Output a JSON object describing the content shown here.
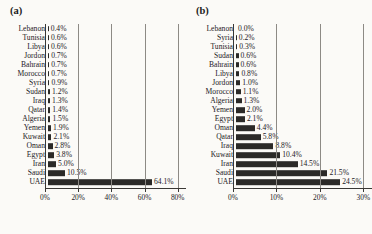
{
  "figure": {
    "background_color": "#fbfaf7",
    "bar_color": "#2b2a28",
    "grid_color": "#8d8a85",
    "axis_color": "#3a3835"
  },
  "panels": [
    {
      "label": "(a)",
      "name": "panel-a"
    },
    {
      "label": "(b)",
      "name": "panel-b"
    }
  ],
  "chart_data": [
    {
      "type": "bar",
      "orientation": "horizontal",
      "title": "(a)",
      "xlabel": "",
      "ylabel": "",
      "xlim": [
        0,
        85
      ],
      "grid": true,
      "legend": "none",
      "xticks": [
        0,
        20,
        40,
        60,
        80
      ],
      "xticklabels": [
        "0%",
        "20%",
        "40%",
        "60%",
        "80%"
      ],
      "categories": [
        "Lebanon",
        "Tunisia",
        "Libya",
        "Jordon",
        "Bahrain",
        "Morocco",
        "Syria",
        "Sudan",
        "Iraq",
        "Qatar",
        "Algeria",
        "Yemen",
        "Kuwait",
        "Oman",
        "Egypt",
        "Iran",
        "Saudi",
        "UAE"
      ],
      "values": [
        0.4,
        0.6,
        0.6,
        0.7,
        0.7,
        0.7,
        0.9,
        1.2,
        1.3,
        1.4,
        1.5,
        1.9,
        2.1,
        2.8,
        3.8,
        5.0,
        10.5,
        64.1
      ],
      "value_labels": [
        "0.4%",
        "0.6%",
        "0.6%",
        "0.7%",
        "0.7%",
        "0.7%",
        "0.9%",
        "1.2%",
        "1.3%",
        "1.4%",
        "1.5%",
        "1.9%",
        "2.1%",
        "2.8%",
        "3.8%",
        "5.0%",
        "10.5%",
        "64.1%"
      ]
    },
    {
      "type": "bar",
      "orientation": "horizontal",
      "title": "(b)",
      "xlabel": "",
      "ylabel": "",
      "xlim": [
        0,
        32
      ],
      "grid": true,
      "legend": "none",
      "xticks": [
        0,
        10,
        20,
        30
      ],
      "xticklabels": [
        "0%",
        "10%",
        "20%",
        "30%"
      ],
      "categories": [
        "Lebanon",
        "Syria",
        "Tunisia",
        "Sudan",
        "Bahrain",
        "Libya",
        "Jordon",
        "Morocco",
        "Algeria",
        "Yemen",
        "Egypt",
        "Oman",
        "Qatar",
        "Iraq",
        "Kuwait",
        "Iran",
        "Saudi",
        "UAE"
      ],
      "values": [
        0.0,
        0.2,
        0.3,
        0.6,
        0.6,
        0.8,
        1.0,
        1.1,
        1.3,
        2.0,
        2.1,
        4.4,
        5.8,
        8.8,
        10.4,
        14.5,
        21.5,
        24.5
      ],
      "value_labels": [
        "0.0%",
        "0.2%",
        "0.3%",
        "0.6%",
        "0.6%",
        "0.8%",
        "1.0%",
        "1.1%",
        "1.3%",
        "2.0%",
        "2.1%",
        "4.4%",
        "5.8%",
        "8.8%",
        "10.4%",
        "14.5%",
        "21.5%",
        "24.5%"
      ]
    }
  ]
}
